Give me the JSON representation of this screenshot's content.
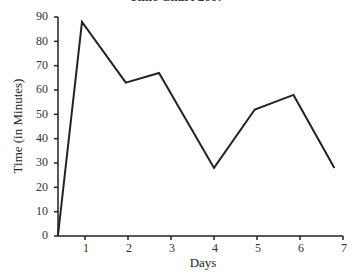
{
  "chart_data": {
    "type": "line",
    "title": "Time Chart 2007",
    "xlabel": "Days",
    "ylabel": "Time (in Minutes)",
    "x_ticks": [
      "1",
      "2",
      "3",
      "4",
      "5",
      "6",
      "7"
    ],
    "y_ticks": [
      "0",
      "10",
      "20",
      "30",
      "40",
      "50",
      "60",
      "70",
      "80",
      "90"
    ],
    "xlim": [
      0.37,
      7
    ],
    "ylim": [
      0,
      90
    ],
    "grid": false,
    "legend": null,
    "series": [
      {
        "name": "Time",
        "color": "#222222",
        "x": [
          0.37,
          0.93,
          1.95,
          2.72,
          4.0,
          4.95,
          5.85,
          6.8
        ],
        "values": [
          0,
          88,
          63,
          67,
          28,
          52,
          58,
          28
        ]
      }
    ]
  }
}
